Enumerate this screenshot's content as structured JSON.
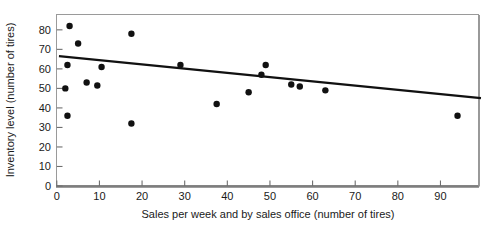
{
  "chart_data": {
    "type": "scatter",
    "title": "",
    "xlabel": "Sales per week and by sales office (number of tires)",
    "ylabel": "Inventory level (number of tires)",
    "xlim": [
      0,
      100
    ],
    "ylim": [
      0,
      86
    ],
    "grid": false,
    "legend": "none",
    "xticks": [
      0,
      10,
      20,
      30,
      40,
      50,
      60,
      70,
      80,
      90
    ],
    "xtick_labels": [
      "0",
      "10",
      "20",
      "30",
      "40",
      "50",
      "60",
      "70",
      "80",
      "90"
    ],
    "yticks": [
      0,
      10,
      20,
      30,
      40,
      50,
      60,
      70,
      80
    ],
    "ytick_labels": [
      "0",
      "10",
      "20",
      "30",
      "40",
      "50",
      "60",
      "70",
      "80"
    ],
    "marker": "filled-circle",
    "marker_color": "#111111",
    "marker_size": 3.2,
    "points": [
      {
        "x": 3.0,
        "y": 82.0
      },
      {
        "x": 2.5,
        "y": 62.0
      },
      {
        "x": 2.0,
        "y": 50.0
      },
      {
        "x": 2.5,
        "y": 36.0
      },
      {
        "x": 5.0,
        "y": 73.0
      },
      {
        "x": 7.0,
        "y": 53.0
      },
      {
        "x": 9.5,
        "y": 51.5
      },
      {
        "x": 10.5,
        "y": 61.0
      },
      {
        "x": 17.5,
        "y": 78.0
      },
      {
        "x": 17.5,
        "y": 32.0
      },
      {
        "x": 29.0,
        "y": 62.0
      },
      {
        "x": 37.5,
        "y": 42.0
      },
      {
        "x": 45.0,
        "y": 48.0
      },
      {
        "x": 48.0,
        "y": 57.0
      },
      {
        "x": 49.0,
        "y": 62.0
      },
      {
        "x": 55.0,
        "y": 52.0
      },
      {
        "x": 57.0,
        "y": 51.0
      },
      {
        "x": 63.0,
        "y": 49.0
      },
      {
        "x": 94.0,
        "y": 36.0
      }
    ],
    "trendline": {
      "name": "regression-line",
      "x_start": 0.5,
      "y_start": 66.5,
      "x_end": 99.5,
      "y_end": 45.0,
      "color": "#111111",
      "width": 2.2
    }
  },
  "axes": {
    "frame_color": "#8c8c8c",
    "baseline_color": "#7a7a7a"
  }
}
